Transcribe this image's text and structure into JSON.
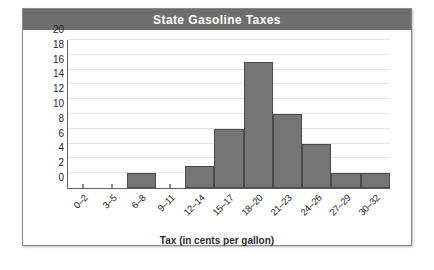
{
  "chart_data": {
    "type": "bar",
    "title": "State Gasoline Taxes",
    "xlabel": "Tax (in cents per gallon)",
    "ylabel": "Number of states",
    "categories": [
      "0–2",
      "3–5",
      "6–8",
      "9–11",
      "12–14",
      "15–17",
      "18–20",
      "21–23",
      "24–26",
      "27–29",
      "30–32"
    ],
    "values": [
      0,
      0,
      2,
      0,
      3,
      8,
      17,
      10,
      6,
      2,
      2
    ],
    "ylim": [
      0,
      20
    ],
    "ytick_labels": [
      "0",
      "2",
      "4",
      "6",
      "8",
      "10",
      "12",
      "14",
      "16",
      "18",
      "20"
    ],
    "ytick_values": [
      0,
      2,
      4,
      6,
      8,
      10,
      12,
      14,
      16,
      18,
      20
    ],
    "ystep": 2,
    "grid": true,
    "legend": false,
    "bar_color": "#757575",
    "bar_edge_color": "#4a4a4a",
    "title_bar_color": "#6e6e6e",
    "title_text_color": "#ffffff",
    "gridline_color": "#e3e3e3",
    "axis_color": "#5f5f5f",
    "background_color": "#ffffff"
  }
}
